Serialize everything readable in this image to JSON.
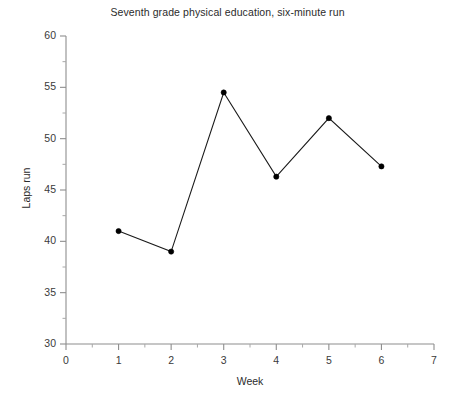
{
  "chart_data": {
    "type": "line",
    "title": "Seventh grade physical education, six-minute run",
    "xlabel": "Week",
    "ylabel": "Laps run",
    "x": [
      1,
      2,
      3,
      4,
      5,
      6
    ],
    "values": [
      41.0,
      39.0,
      54.5,
      46.3,
      52.0,
      47.3
    ],
    "series": [
      {
        "name": "Laps run",
        "values": [
          41.0,
          39.0,
          54.5,
          46.3,
          52.0,
          47.3
        ]
      }
    ],
    "xlim": [
      0,
      7
    ],
    "ylim": [
      30,
      60
    ],
    "x_major_ticks": [
      0,
      1,
      2,
      3,
      4,
      5,
      6,
      7
    ],
    "x_tick_labels": [
      "0",
      "1",
      "2",
      "3",
      "4",
      "5",
      "6",
      "7"
    ],
    "x_minor_ticks": [
      0.5,
      1.5,
      2.5,
      3.5,
      4.5,
      5.5,
      6.5
    ],
    "y_major_ticks": [
      30,
      35,
      40,
      45,
      50,
      55,
      60
    ],
    "y_tick_labels": [
      "30",
      "35",
      "40",
      "45",
      "50",
      "55",
      "60"
    ],
    "y_minor_ticks": [
      32.5,
      37.5,
      42.5,
      47.5,
      52.5,
      57.5
    ],
    "grid": false,
    "legend": false,
    "marker": "filled-circle",
    "line_color": "#000000",
    "marker_color": "#000000",
    "axis_color": "#8e8e8e"
  }
}
